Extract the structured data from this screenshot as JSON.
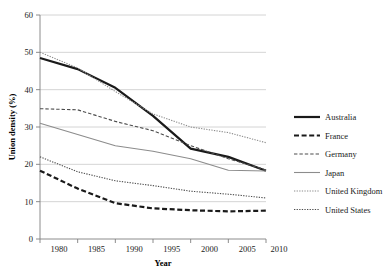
{
  "chart_data": {
    "type": "line",
    "title": "",
    "xlabel": "Year",
    "ylabel": "Union density (%)",
    "x": [
      1980,
      1985,
      1990,
      1995,
      2000,
      2005,
      2010
    ],
    "categories": [
      "1980",
      "1985",
      "1990",
      "1995",
      "2000",
      "2005",
      "2010"
    ],
    "xlim": [
      1980,
      2010
    ],
    "ylim": [
      0,
      60
    ],
    "yticks": [
      0,
      10,
      20,
      30,
      40,
      50,
      60
    ],
    "ytick_labels": [
      "0",
      "10",
      "20",
      "30",
      "40",
      "50",
      "60"
    ],
    "xticks": [
      1980,
      1985,
      1990,
      1995,
      2000,
      2005,
      2010
    ],
    "xtick_labels": [
      "1980",
      "1985",
      "1990",
      "1995",
      "2000",
      "2005",
      "2010"
    ],
    "grid": "horizontal",
    "legend_position": "right",
    "series": [
      {
        "name": "Australia",
        "values": [
          48.5,
          45.5,
          40.5,
          33.0,
          24.2,
          22.0,
          18.3
        ],
        "color": "#1a1a1a",
        "style": "solid",
        "width": 2.2
      },
      {
        "name": "France",
        "values": [
          18.3,
          13.5,
          9.6,
          8.2,
          7.7,
          7.4,
          7.6
        ],
        "color": "#1a1a1a",
        "style": "dashed",
        "width": 2.2
      },
      {
        "name": "Germany",
        "values": [
          34.9,
          34.6,
          31.5,
          29.0,
          25.0,
          21.5,
          18.5
        ],
        "color": "#4d4d4d",
        "style": "dashed",
        "width": 1.1
      },
      {
        "name": "Japan",
        "values": [
          31.0,
          28.0,
          25.0,
          23.5,
          21.5,
          18.4,
          18.2
        ],
        "color": "#8c8c8c",
        "style": "solid",
        "width": 1.1
      },
      {
        "name": "United Kingdom",
        "values": [
          50.0,
          45.8,
          39.5,
          33.5,
          30.0,
          28.5,
          25.8
        ],
        "color": "#8c8c8c",
        "style": "dotted",
        "width": 1.1
      },
      {
        "name": "United States",
        "values": [
          22.0,
          18.0,
          15.6,
          14.3,
          12.8,
          12.0,
          11.0
        ],
        "color": "#4d4d4d",
        "style": "dotted",
        "width": 1.1
      }
    ],
    "colors": {
      "background": "#ffffff",
      "gridline": "#c9c9c9",
      "axis": "#808080",
      "text": "#1a1a1a"
    }
  },
  "legend": {
    "items": [
      {
        "label": "Australia"
      },
      {
        "label": "France"
      },
      {
        "label": "Germany"
      },
      {
        "label": "Japan"
      },
      {
        "label": "United Kingdom"
      },
      {
        "label": "United States"
      }
    ]
  },
  "axes": {
    "y_title": "Union density (%)",
    "x_title": "Year",
    "y_ticks": [
      "60",
      "50",
      "40",
      "30",
      "20",
      "10",
      "0"
    ],
    "x_ticks": [
      "1980",
      "1985",
      "1990",
      "1995",
      "2000",
      "2005",
      "2010"
    ]
  }
}
